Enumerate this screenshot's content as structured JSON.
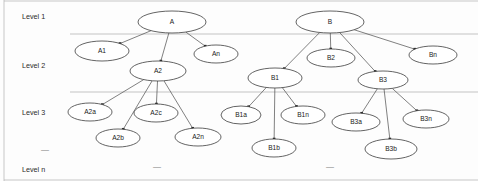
{
  "figure": {
    "width": 478,
    "height": 181,
    "background_color": "#fdfdfd",
    "node_stroke_color": "#3c3c3c",
    "node_fill_color": "#ffffff",
    "edge_color": "#4a4a4a",
    "divider_color": "#aaaaaa",
    "frame_color": "#b9b9b9"
  },
  "level_labels": [
    {
      "id": "level-1",
      "text": "Level 1",
      "x": 22,
      "y": 17
    },
    {
      "id": "level-2",
      "text": "Level 2",
      "x": 22,
      "y": 66
    },
    {
      "id": "level-3",
      "text": "Level 3",
      "x": 22,
      "y": 113
    },
    {
      "id": "level-n",
      "text": "Level n",
      "x": 22,
      "y": 170
    }
  ],
  "dividers": [
    {
      "id": "divider-level1-level2",
      "x1": 70,
      "y1": 34,
      "x2": 478,
      "y2": 34
    },
    {
      "id": "divider-level2-level3",
      "x1": 70,
      "y1": 92,
      "x2": 478,
      "y2": 92
    }
  ],
  "frame": {
    "left_line": {
      "x1": 4,
      "y1": 0,
      "x2": 4,
      "y2": 181
    },
    "top_line": {
      "x1": 4,
      "y1": 1,
      "x2": 478,
      "y2": 1
    },
    "bottom_line": {
      "x1": 4,
      "y1": 180,
      "x2": 478,
      "y2": 180
    }
  },
  "ellipsis_marks": [
    {
      "id": "ellipsis-left",
      "text": "—",
      "x": 45,
      "y": 150
    },
    {
      "id": "ellipsis-mid-left",
      "text": "—",
      "x": 157,
      "y": 167
    },
    {
      "id": "ellipsis-mid-right",
      "text": "—",
      "x": 330,
      "y": 167
    }
  ],
  "chart_data": {
    "type": "tree",
    "levels": [
      "Level 1",
      "Level 2",
      "Level 3",
      "Level n"
    ],
    "nodes": [
      {
        "id": "A",
        "label": "A",
        "cx": 172,
        "cy": 22,
        "rx": 34,
        "ry": 11,
        "level": 1
      },
      {
        "id": "B",
        "label": "B",
        "cx": 330,
        "cy": 22,
        "rx": 34,
        "ry": 11,
        "level": 1
      },
      {
        "id": "A1",
        "label": "A1",
        "cx": 102,
        "cy": 51,
        "rx": 27,
        "ry": 10,
        "level": 2
      },
      {
        "id": "A2",
        "label": "A2",
        "cx": 158,
        "cy": 71,
        "rx": 28,
        "ry": 10,
        "level": 2
      },
      {
        "id": "An",
        "label": "An",
        "cx": 216,
        "cy": 54,
        "rx": 22,
        "ry": 9,
        "level": 2
      },
      {
        "id": "B1",
        "label": "B1",
        "cx": 275,
        "cy": 78,
        "rx": 27,
        "ry": 10,
        "level": 2
      },
      {
        "id": "B2",
        "label": "B2",
        "cx": 331,
        "cy": 58,
        "rx": 24,
        "ry": 9,
        "level": 2
      },
      {
        "id": "B3",
        "label": "B3",
        "cx": 383,
        "cy": 80,
        "rx": 25,
        "ry": 9,
        "level": 2
      },
      {
        "id": "Bn",
        "label": "Bn",
        "cx": 433,
        "cy": 55,
        "rx": 24,
        "ry": 9,
        "level": 2
      },
      {
        "id": "A2a",
        "label": "A2a",
        "cx": 90,
        "cy": 112,
        "rx": 22,
        "ry": 9,
        "level": 3
      },
      {
        "id": "A2b",
        "label": "A2b",
        "cx": 118,
        "cy": 138,
        "rx": 22,
        "ry": 9,
        "level": 3
      },
      {
        "id": "A2c",
        "label": "A2c",
        "cx": 156,
        "cy": 113,
        "rx": 22,
        "ry": 9,
        "level": 3
      },
      {
        "id": "A2n",
        "label": "A2n",
        "cx": 198,
        "cy": 137,
        "rx": 23,
        "ry": 9,
        "level": 3
      },
      {
        "id": "B1a",
        "label": "B1a",
        "cx": 241,
        "cy": 115,
        "rx": 20,
        "ry": 9,
        "level": 3
      },
      {
        "id": "B1b",
        "label": "B1b",
        "cx": 274,
        "cy": 148,
        "rx": 22,
        "ry": 9,
        "level": 3
      },
      {
        "id": "B1n",
        "label": "B1n",
        "cx": 303,
        "cy": 115,
        "rx": 22,
        "ry": 9,
        "level": 3
      },
      {
        "id": "B3a",
        "label": "B3a",
        "cx": 356,
        "cy": 122,
        "rx": 24,
        "ry": 9,
        "level": 3
      },
      {
        "id": "B3b",
        "label": "B3b",
        "cx": 391,
        "cy": 149,
        "rx": 26,
        "ry": 10,
        "level": 3
      },
      {
        "id": "B3n",
        "label": "B3n",
        "cx": 426,
        "cy": 119,
        "rx": 23,
        "ry": 9,
        "level": 3
      }
    ],
    "edges": [
      {
        "from": "A",
        "to": "A1"
      },
      {
        "from": "A",
        "to": "A2"
      },
      {
        "from": "A",
        "to": "An"
      },
      {
        "from": "B",
        "to": "B1"
      },
      {
        "from": "B",
        "to": "B2"
      },
      {
        "from": "B",
        "to": "B3"
      },
      {
        "from": "B",
        "to": "Bn"
      },
      {
        "from": "A2",
        "to": "A2a"
      },
      {
        "from": "A2",
        "to": "A2b"
      },
      {
        "from": "A2",
        "to": "A2c"
      },
      {
        "from": "A2",
        "to": "A2n"
      },
      {
        "from": "B1",
        "to": "B1a"
      },
      {
        "from": "B1",
        "to": "B1b"
      },
      {
        "from": "B1",
        "to": "B1n"
      },
      {
        "from": "B3",
        "to": "B3a"
      },
      {
        "from": "B3",
        "to": "B3b"
      },
      {
        "from": "B3",
        "to": "B3n"
      }
    ]
  }
}
